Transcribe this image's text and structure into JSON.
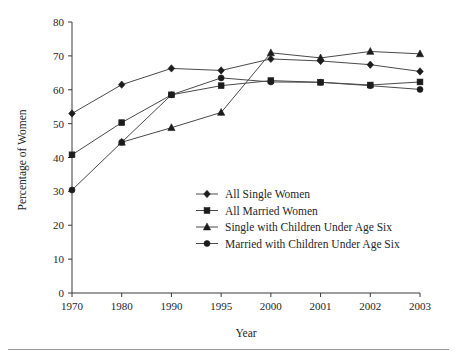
{
  "chart_data": {
    "type": "line",
    "title": "",
    "xlabel": "Year",
    "ylabel": "Percentage of Women",
    "categories": [
      "1970",
      "1980",
      "1990",
      "1995",
      "2000",
      "2001",
      "2002",
      "2003"
    ],
    "ylim": [
      0,
      80
    ],
    "yticks": [
      0,
      10,
      20,
      30,
      40,
      50,
      60,
      70,
      80
    ],
    "ytick_labels": [
      "0",
      "10",
      "20",
      "30",
      "40",
      "50",
      "60",
      "70",
      "80"
    ],
    "grid": false,
    "legend_position": "inside lower-center-right",
    "series": [
      {
        "name": "All Single Women",
        "marker": "diamond",
        "color": "#1c1c1c",
        "values": [
          53.0,
          61.5,
          66.3,
          65.7,
          69.1,
          68.5,
          67.4,
          65.4
        ]
      },
      {
        "name": "All Married Women",
        "marker": "square",
        "color": "#1c1c1c",
        "values": [
          40.8,
          50.3,
          58.5,
          61.2,
          62.7,
          62.2,
          61.4,
          62.3
        ]
      },
      {
        "name": "Single with Children Under Age Six",
        "marker": "triangle",
        "color": "#1c1c1c",
        "values": [
          null,
          44.5,
          48.8,
          53.3,
          70.9,
          69.4,
          71.3,
          70.6
        ]
      },
      {
        "name": "Married with Children Under Age Six",
        "marker": "circle",
        "color": "#1c1c1c",
        "values": [
          30.4,
          44.5,
          58.5,
          63.5,
          62.3,
          62.2,
          61.2,
          60.1
        ]
      }
    ]
  },
  "figure": {
    "background_color": "#ffffff",
    "axis_color": "#3a3a3a",
    "rule_color": "#9a9a9a"
  }
}
